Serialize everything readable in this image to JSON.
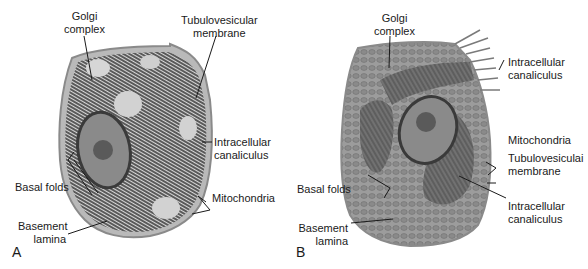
{
  "figure": {
    "panels": [
      {
        "letter": "A",
        "labels": {
          "golgi_1": "Golgi",
          "golgi_2": "complex",
          "tubulo_1": "Tubulovesicular",
          "tubulo_2": "membrane",
          "canal_1": "Intracellular",
          "canal_2": "canaliculus",
          "basal": "Basal folds",
          "mito": "Mitochondria",
          "basement_1": "Basement",
          "basement_2": "lamina"
        }
      },
      {
        "letter": "B",
        "labels": {
          "golgi_1": "Golgi",
          "golgi_2": "complex",
          "canal_top_1": "Intracellular",
          "canal_top_2": "canaliculus",
          "mito": "Mitochondria",
          "tubulo_1": "Tubulovesiculai",
          "tubulo_2": "membrane",
          "basal": "Basal folds",
          "canal_bot_1": "Intracellular",
          "canal_bot_2": "canaliculus",
          "basement_1": "Basement",
          "basement_2": "lamina"
        }
      }
    ]
  }
}
